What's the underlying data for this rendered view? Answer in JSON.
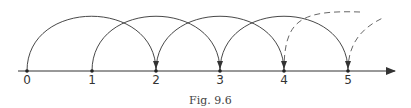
{
  "figure": {
    "caption": "Fig. 9.6",
    "ticks": [
      "0",
      "1",
      "2",
      "3",
      "4",
      "5"
    ],
    "tick_x": [
      27,
      92,
      156,
      220,
      284,
      348
    ],
    "axis_y": 71,
    "arcs_solid": [
      [
        0,
        2
      ],
      [
        1,
        3
      ],
      [
        2,
        4
      ],
      [
        3,
        5
      ]
    ],
    "arcs_dashed": [
      [
        4,
        6
      ],
      [
        5,
        7
      ]
    ],
    "colors": {
      "line": "#333333",
      "dashed": "#555555"
    }
  }
}
